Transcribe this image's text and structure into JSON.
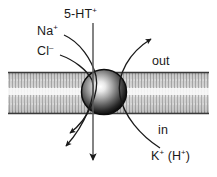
{
  "figure": {
    "width": 217,
    "height": 177,
    "background_color": "#ffffff",
    "line_color": "#1a1a1a"
  },
  "labels": {
    "substrate": "5-HT",
    "substrate_charge": "+",
    "sodium": "Na",
    "sodium_charge": "+",
    "chloride": "Cl",
    "chloride_charge": "–",
    "extracellular": "out",
    "intracellular": "in",
    "potassium": "K",
    "potassium_charge": "+",
    "potassium_alt_open": " (H",
    "potassium_alt_charge": "+",
    "potassium_alt_close": ")"
  },
  "membrane": {
    "name": "lipid-bilayer",
    "top_y": 72,
    "bottom_y": 114,
    "edge_color": "#4a4a4a",
    "fill_color": "#d8d8d8"
  },
  "transporter": {
    "name": "transporter-protein",
    "center_x": 104,
    "center_y": 92,
    "radius": 22,
    "highlight_color": "#f2f2f2",
    "edge_color": "#141414"
  },
  "arrows": [
    {
      "name": "sodium-influx-arrow",
      "species": "Na+",
      "direction": "inward",
      "from": "extracellular",
      "to": "intracellular"
    },
    {
      "name": "chloride-influx-arrow",
      "species": "Cl-",
      "direction": "inward",
      "from": "extracellular",
      "to": "intracellular"
    },
    {
      "name": "serotonin-influx-arrow",
      "species": "5-HT+",
      "direction": "inward",
      "from": "extracellular",
      "to": "intracellular"
    },
    {
      "name": "potassium-efflux-arrow",
      "species": "K+ (H+)",
      "direction": "outward",
      "from": "intracellular",
      "to": "extracellular"
    }
  ]
}
